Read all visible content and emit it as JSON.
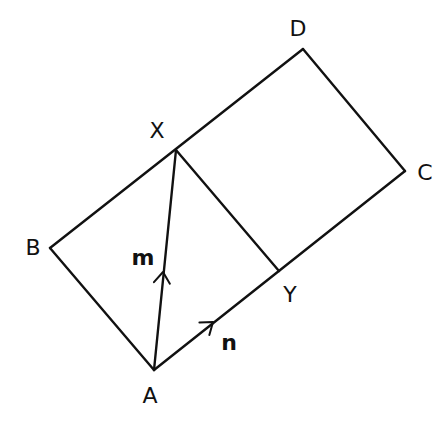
{
  "diagram": {
    "type": "geometry",
    "stroke_color": "#111111",
    "background": "#ffffff",
    "points": {
      "A": {
        "label": "A",
        "x": 154,
        "y": 370,
        "label_x": 150,
        "label_y": 396
      },
      "B": {
        "label": "B",
        "x": 50,
        "y": 248,
        "label_x": 33,
        "label_y": 248
      },
      "C": {
        "label": "C",
        "x": 405,
        "y": 171,
        "label_x": 425,
        "label_y": 173
      },
      "D": {
        "label": "D",
        "x": 303,
        "y": 49,
        "label_x": 298,
        "label_y": 29
      },
      "X": {
        "label": "X",
        "x": 176,
        "y": 150,
        "label_x": 157,
        "label_y": 131
      },
      "Y": {
        "label": "Y",
        "x": 279,
        "y": 271,
        "label_x": 290,
        "label_y": 295
      }
    },
    "segments": [
      {
        "from": "A",
        "to": "B"
      },
      {
        "from": "B",
        "to": "D"
      },
      {
        "from": "D",
        "to": "C"
      },
      {
        "from": "C",
        "to": "A"
      },
      {
        "from": "X",
        "to": "Y"
      },
      {
        "from": "A",
        "to": "X"
      }
    ],
    "vectors": {
      "m": {
        "label": "m",
        "from": "A",
        "to": "X",
        "arrow_x": 163,
        "arrow_y": 272,
        "label_x": 143,
        "label_y": 258
      },
      "n": {
        "label": "n",
        "from": "A",
        "to": "Y",
        "arrow_x": 213,
        "arrow_y": 322,
        "label_x": 229,
        "label_y": 343
      }
    }
  }
}
